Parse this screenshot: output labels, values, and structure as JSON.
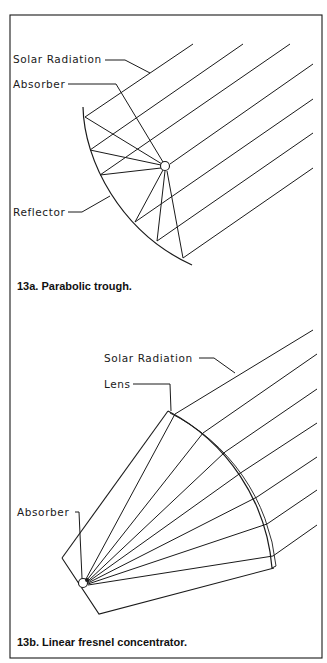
{
  "figure_13a": {
    "labels": {
      "solar_radiation": "Solar Radiation",
      "absorber": "Absorber",
      "reflector": "Reflector"
    },
    "caption": "13a. Parabolic trough."
  },
  "figure_13b": {
    "labels": {
      "solar_radiation": "Solar Radiation",
      "lens": "Lens",
      "absorber": "Absorber"
    },
    "caption": "13b. Linear fresnel concentrator."
  },
  "colors": {
    "ink": "#1a1a1a",
    "paper": "#ffffff"
  }
}
